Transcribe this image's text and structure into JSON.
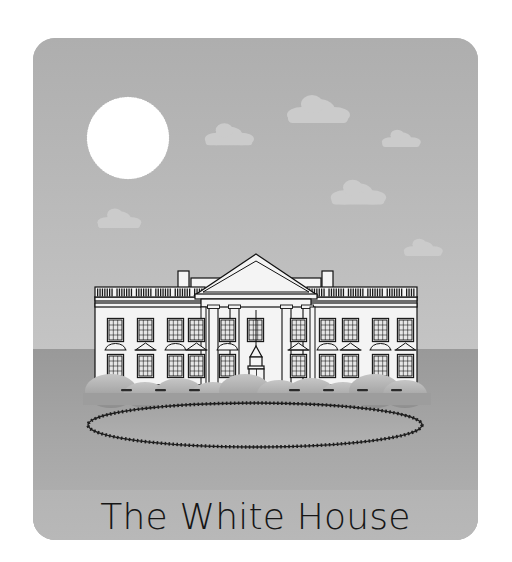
{
  "page": {
    "background_color": "#ffffff",
    "width": 512,
    "height": 562
  },
  "card": {
    "name": "white-house-illustration-card",
    "background_color": "#b4b4b4",
    "corner_radius": 22,
    "x": 33,
    "y": 38,
    "width": 445,
    "height": 502
  },
  "caption": {
    "text": "The White House",
    "color": "#151515",
    "font_size": 36
  },
  "scene": {
    "sky": {
      "name": "sky",
      "color_top": "#b0b0b0",
      "color_bottom": "#c2c2c2",
      "horizon_y": 310
    },
    "ground": {
      "name": "ground",
      "color_top": "#9a9a9a",
      "color_bottom": "#b0b0b0"
    },
    "sun": {
      "name": "sun",
      "color": "#ffffff",
      "cx": 95,
      "cy": 100,
      "r": 40,
      "ray_count": 96
    },
    "clouds": [
      {
        "cx": 285,
        "cy": 72,
        "scale": 1.0,
        "color": "#cbcbcb"
      },
      {
        "cx": 196,
        "cy": 97,
        "scale": 0.78,
        "color": "#cbcbcb"
      },
      {
        "cx": 368,
        "cy": 101,
        "scale": 0.62,
        "color": "#cbcbcb"
      },
      {
        "cx": 325,
        "cy": 155,
        "scale": 0.88,
        "color": "#cbcbcb"
      },
      {
        "cx": 86,
        "cy": 181,
        "scale": 0.7,
        "color": "#cbcbcb"
      },
      {
        "cx": 390,
        "cy": 210,
        "scale": 0.62,
        "color": "#cbcbcb"
      }
    ],
    "flag": {
      "name": "us-flag",
      "pole_x": 222,
      "pole_top": 176,
      "pole_bottom": 222,
      "flag_x": 222,
      "flag_y": 178,
      "flag_w": 42,
      "flag_h": 25,
      "stripe_count": 13,
      "canton_color": "#3a3a3a",
      "stripe_dark": "#3a3a3a",
      "stripe_light": "#ffffff"
    },
    "building": {
      "name": "white-house-building",
      "wall_color": "#f4f4f4",
      "outline_color": "#111111",
      "left_wing": {
        "x": 62,
        "y": 251,
        "w": 108,
        "h": 94
      },
      "right_wing": {
        "x": 275,
        "y": 251,
        "w": 108,
        "h": 94
      },
      "portico": {
        "x": 170,
        "y": 217,
        "w": 105,
        "h": 128
      },
      "pediment_apex_y": 217,
      "column_count": 4,
      "chimneys": [
        {
          "x": 145,
          "y": 234,
          "w": 11,
          "h": 22
        },
        {
          "x": 290,
          "y": 234,
          "w": 11,
          "h": 22
        }
      ],
      "balustrade": {
        "y": 251,
        "height": 9,
        "baluster_groups": 8
      },
      "left_windows_top": 4,
      "left_windows_bottom": 4,
      "right_windows_top": 4,
      "right_windows_bottom": 4,
      "portico_windows_top": 3,
      "portico_windows_bottom": 3,
      "doorway": {
        "x": 216,
        "y": 318,
        "w": 17,
        "h": 27
      },
      "chandelier": {
        "x": 224,
        "y": 268,
        "drop": 40
      }
    },
    "bushes": {
      "name": "hedge-row",
      "color_top": "#c0c0c0",
      "color_bottom": "#8f8f8f",
      "count": 11,
      "y": 345
    },
    "lawn_oval": {
      "name": "lawn-oval",
      "cx": 222,
      "cy": 386,
      "rx": 168,
      "ry": 22,
      "outline_color": "#202020",
      "fill_color": "#a8a8a8",
      "dash_count": 150
    }
  }
}
